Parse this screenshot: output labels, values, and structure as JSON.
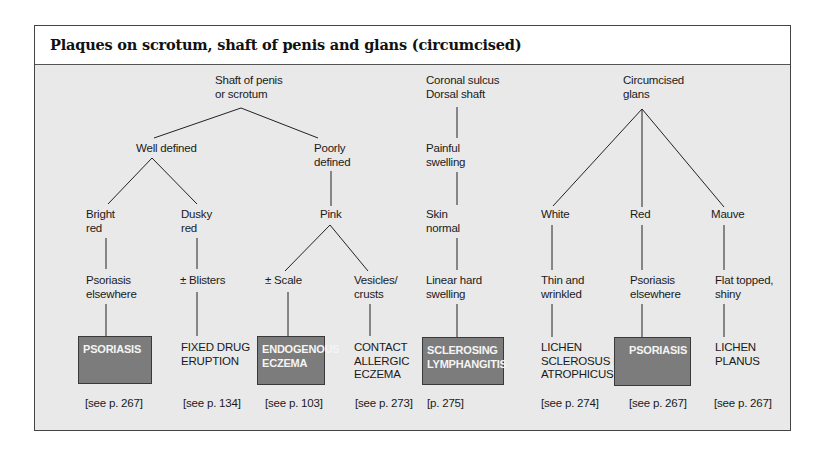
{
  "title": "Plaques on scrotum, shaft of penis and glans (circumcised)",
  "colors": {
    "background": "#e9e9e9",
    "diagnosis_box": "#7c7c7c",
    "diagnosis_text": "#f4f4f4"
  },
  "tree": {
    "shaft": {
      "root": [
        "Shaft of penis",
        "or scrotum"
      ],
      "well_defined": "Well defined",
      "poorly_defined": [
        "Poorly",
        "defined"
      ],
      "bright_red": [
        "Bright",
        "red"
      ],
      "dusky_red": [
        "Dusky",
        "red"
      ],
      "pink": "Pink",
      "psoriasis_elsewhere": [
        "Psoriasis",
        "elsewhere"
      ],
      "blisters": "± Blisters",
      "scale": "± Scale",
      "vesicles": [
        "Vesicles/",
        "crusts"
      ]
    },
    "coronal": {
      "root": [
        "Coronal sulcus",
        "Dorsal shaft"
      ],
      "painful": [
        "Painful",
        "swelling"
      ],
      "skin_normal": [
        "Skin",
        "normal"
      ],
      "linear": [
        "Linear hard",
        "swelling"
      ]
    },
    "glans": {
      "root": [
        "Circumcised",
        "glans"
      ],
      "white": "White",
      "red": "Red",
      "mauve": "Mauve",
      "thin": [
        "Thin and",
        "wrinkled"
      ],
      "psoriasis_elsewhere": [
        "Psoriasis",
        "elsewhere"
      ],
      "flat": [
        "Flat topped,",
        "shiny"
      ]
    }
  },
  "diagnoses": [
    {
      "label": "PSORIASIS",
      "highlighted": true,
      "ref": "[see p. 267]"
    },
    {
      "label": "FIXED DRUG\nERUPTION",
      "highlighted": false,
      "ref": "[see p. 134]"
    },
    {
      "label": "ENDOGENOUS\nECZEMA",
      "highlighted": true,
      "ref": "[see p. 103]"
    },
    {
      "label": "CONTACT\nALLERGIC\nECZEMA",
      "highlighted": false,
      "ref": "[see p. 273]"
    },
    {
      "label": "SCLEROSING\nLYMPHANGITIS",
      "highlighted": true,
      "ref": "[p. 275]"
    },
    {
      "label": "LICHEN\nSCLEROSUS ET\nATROPHICUS",
      "highlighted": false,
      "ref": "[see p. 274]"
    },
    {
      "label": "PSORIASIS",
      "highlighted": true,
      "ref": "[see p. 267]"
    },
    {
      "label": "LICHEN\nPLANUS",
      "highlighted": false,
      "ref": "[see p. 267]"
    }
  ]
}
